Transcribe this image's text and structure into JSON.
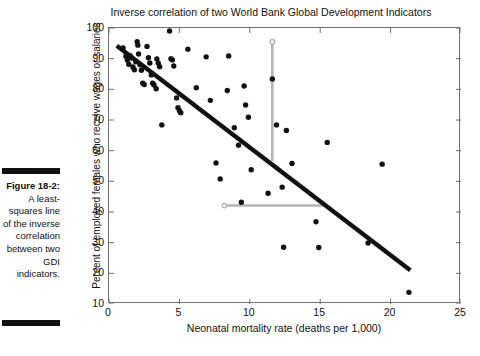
{
  "figure": {
    "label": "Figure 18-2:",
    "caption": "A least-squares line of the inverse correlation between two GDI indicators."
  },
  "chart_data": {
    "type": "scatter",
    "title": "Inverse correlation of two World Bank Global Development Indicators",
    "xlabel": "Neonatal mortality rate (deaths per 1,000)",
    "ylabel": "Percent of employed females who receive wages or salaries",
    "xlim": [
      0,
      25
    ],
    "ylim": [
      10,
      100
    ],
    "xticks": [
      0,
      5,
      10,
      15,
      20,
      25
    ],
    "yticks": [
      10,
      20,
      30,
      40,
      50,
      60,
      70,
      80,
      90,
      100
    ],
    "grid": false,
    "legend": "none",
    "marker_color": "#111111",
    "fit_line_color": "#111111",
    "annotation_color": "#b3b3b3",
    "points": [
      [
        1.0,
        93.5
      ],
      [
        1.2,
        90.8
      ],
      [
        1.3,
        89.6
      ],
      [
        1.4,
        88.2
      ],
      [
        1.5,
        91.0
      ],
      [
        1.6,
        90.2
      ],
      [
        1.7,
        87.3
      ],
      [
        1.8,
        86.4
      ],
      [
        1.9,
        89.0
      ],
      [
        2.0,
        95.5
      ],
      [
        2.05,
        94.4
      ],
      [
        2.1,
        91.5
      ],
      [
        2.2,
        88.0
      ],
      [
        2.3,
        86.2
      ],
      [
        2.4,
        82.0
      ],
      [
        2.5,
        81.6
      ],
      [
        2.7,
        94.0
      ],
      [
        2.8,
        90.3
      ],
      [
        2.9,
        88.6
      ],
      [
        3.0,
        84.7
      ],
      [
        3.1,
        82.0
      ],
      [
        3.2,
        81.4
      ],
      [
        3.35,
        80.2
      ],
      [
        3.4,
        89.9
      ],
      [
        3.5,
        88.5
      ],
      [
        3.6,
        87.4
      ],
      [
        3.75,
        68.4
      ],
      [
        4.3,
        99.0
      ],
      [
        4.4,
        90.0
      ],
      [
        4.5,
        89.6
      ],
      [
        4.6,
        87.6
      ],
      [
        4.8,
        77.2
      ],
      [
        4.9,
        74.0
      ],
      [
        5.0,
        73.0
      ],
      [
        5.1,
        72.4
      ],
      [
        5.6,
        93.1
      ],
      [
        6.2,
        80.5
      ],
      [
        6.9,
        90.6
      ],
      [
        7.2,
        76.4
      ],
      [
        7.6,
        56.0
      ],
      [
        7.9,
        50.8
      ],
      [
        8.4,
        79.6
      ],
      [
        8.5,
        90.9
      ],
      [
        8.9,
        67.5
      ],
      [
        9.2,
        61.8
      ],
      [
        9.4,
        43.2
      ],
      [
        9.6,
        81.1
      ],
      [
        9.7,
        74.9
      ],
      [
        9.9,
        70.9
      ],
      [
        10.1,
        53.8
      ],
      [
        11.3,
        46.1
      ],
      [
        11.6,
        83.4
      ],
      [
        11.9,
        68.4
      ],
      [
        12.3,
        48.1
      ],
      [
        12.4,
        28.5
      ],
      [
        12.6,
        66.6
      ],
      [
        13.0,
        55.8
      ],
      [
        14.7,
        36.8
      ],
      [
        14.9,
        28.4
      ],
      [
        15.5,
        62.7
      ],
      [
        18.4,
        29.9
      ],
      [
        19.4,
        55.6
      ],
      [
        21.3,
        13.8
      ]
    ],
    "fit_line": {
      "x1": 0.55,
      "y1": 94.2,
      "x2": 21.4,
      "y2": 21.0
    },
    "annotations": [
      {
        "name": "vertical-guide",
        "x1": 11.6,
        "y1": 95.5,
        "x2": 11.6,
        "y2": 56.6,
        "open_marker_at": "top"
      },
      {
        "name": "horizontal-guide",
        "x1": 8.2,
        "y1": 42.1,
        "x2": 15.4,
        "y2": 42.1,
        "open_marker_at": "left"
      }
    ]
  }
}
